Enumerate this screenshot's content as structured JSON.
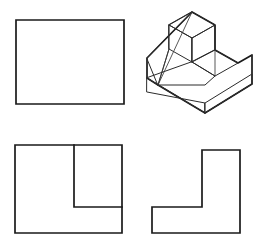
{
  "sheet": {
    "width": 263,
    "height": 250,
    "background": "#ffffff",
    "line_color": "#1a1a1a",
    "thin_line_color": "#3a3a3a",
    "title": "Multiview orthographic drawing with isometric pictorial"
  },
  "views": {
    "front": {
      "name": "front-view",
      "shape": "rectangle",
      "points": "16,20 124,20 124,104 16,104"
    },
    "pictorial": {
      "name": "isometric-view",
      "shape": "stepped-block-with-angled-rib",
      "outline": "192,12 215,25 215,50 238,63 252,55 252,84 205,113 158,85 147,78 147,58",
      "top_upper_face": "192,12 215,25 192,38 169,25",
      "upper_front_face": "169,25 192,38 192,62 169,49",
      "upper_right_face": "192,38 215,25 215,50 192,62",
      "step_top_face": "215,50 238,63 215,76 192,62",
      "step_right_face": "238,63 252,55 252,84 238,90",
      "base_top_face": "192,62 215,76 205,85 158,85 147,78",
      "base_front_left_face": "147,78 158,85 205,113 205,103 147,92",
      "base_front_right_face": "205,113 252,84 252,74 205,103",
      "rib_face": "147,58 192,12 169,25 169,49 158,85",
      "rib_inner_edge": "169,49 158,85",
      "rib_diagonal": "192,12 158,85",
      "vertical_edge_center": "192,38 192,62",
      "vertical_edge_left": "147,58 147,78",
      "vertical_edge_step": "215,50 215,76",
      "vertical_edge_right": "252,55 252,84",
      "base_bottom_edge_left": "147,78 205,113",
      "base_bottom_edge_right": "205,113 252,84"
    },
    "top": {
      "name": "top-view",
      "shape": "L-shape-with-notch",
      "points": "15,145 122,145 122,178 74,178 74,207 15,207",
      "description": "L-shaped profile, notch at upper area, outer boundary extends to bottom",
      "outer_points": "15,145 122,145 122,233 15,233",
      "notch_points": "74,145 74,207 122,207"
    },
    "side": {
      "name": "side-view",
      "shape": "L-shape-mirrored",
      "points": "202,150 240,150 240,233 152,233 152,207 202,207"
    }
  },
  "labels": {
    "front_view": "Front view",
    "pictorial_view": "Isometric pictorial",
    "top_view": "Top view",
    "side_view": "Side view"
  }
}
